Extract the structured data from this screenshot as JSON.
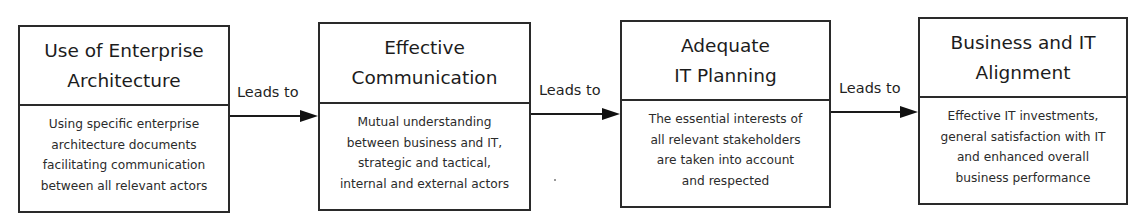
{
  "diagram": {
    "type": "flow",
    "direction": "left-to-right",
    "nodes": [
      {
        "title": "Use of Enterprise\nArchitecture",
        "description": "Using specific enterprise\narchitecture documents\nfacilitating communication\nbetween all relevant actors"
      },
      {
        "title": "Effective\nCommunication",
        "description": "Mutual understanding\nbetween business and IT,\nstrategic and tactical,\ninternal and external actors"
      },
      {
        "title": "Adequate\nIT Planning",
        "description": "The essential interests of\nall relevant stakeholders\nare taken into account\nand respected"
      },
      {
        "title": "Business and IT\nAlignment",
        "description": "Effective IT investments,\ngeneral satisfaction with IT\nand enhanced overall\nbusiness performance"
      }
    ],
    "edges": [
      {
        "from": 0,
        "to": 1,
        "label": "Leads to"
      },
      {
        "from": 1,
        "to": 2,
        "label": "Leads to"
      },
      {
        "from": 2,
        "to": 3,
        "label": "Leads to"
      }
    ],
    "colors": {
      "border": "#2a2a2a",
      "text": "#1f1f1f",
      "arrow": "#111111",
      "background": "#ffffff"
    }
  }
}
